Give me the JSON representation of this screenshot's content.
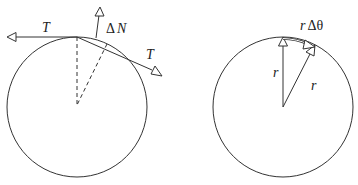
{
  "left_diagram": {
    "circle": {
      "cx": 77,
      "cy": 107,
      "r": 70
    },
    "labels": {
      "tension_left": "T",
      "delta_n_symbol": "Δ",
      "delta_n_var": "N",
      "tension_right": "T"
    }
  },
  "right_diagram": {
    "circle": {
      "cx": 283,
      "cy": 107,
      "r": 70
    },
    "labels": {
      "arc_r": "r",
      "arc_delta_theta": "Δθ",
      "radius_vertical": "r",
      "radius_slanted": "r"
    }
  },
  "colors": {
    "stroke": "#333333",
    "background": "#ffffff"
  }
}
